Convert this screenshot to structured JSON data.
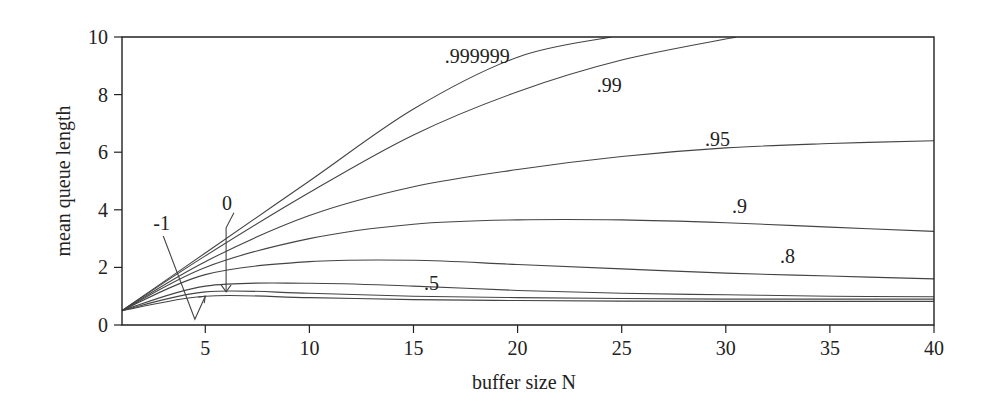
{
  "chart_data": {
    "type": "line",
    "title": "",
    "xlabel": "buffer size N",
    "ylabel": "mean queue length",
    "xlim": [
      1,
      40
    ],
    "ylim": [
      0,
      10
    ],
    "xticks": [
      5,
      10,
      15,
      20,
      25,
      30,
      35,
      40
    ],
    "yticks": [
      0,
      2,
      4,
      6,
      8,
      10
    ],
    "grid": false,
    "legend": "inline curve labels",
    "series": [
      {
        "name": ".999999",
        "x": [
          1,
          5,
          10,
          15,
          20,
          24.5
        ],
        "y": [
          0.5,
          2.5,
          5.0,
          7.5,
          9.3,
          10.0
        ]
      },
      {
        "name": ".99",
        "x": [
          1,
          5,
          10,
          15,
          20,
          25,
          30.5
        ],
        "y": [
          0.5,
          2.4,
          4.6,
          6.6,
          8.1,
          9.2,
          10.0
        ]
      },
      {
        "name": ".95",
        "x": [
          1,
          5,
          10,
          15,
          20,
          25,
          30,
          35,
          40
        ],
        "y": [
          0.5,
          2.2,
          3.8,
          4.8,
          5.4,
          5.85,
          6.15,
          6.3,
          6.4
        ]
      },
      {
        "name": ".9",
        "x": [
          1,
          5,
          10,
          15,
          20,
          25,
          30,
          35,
          40
        ],
        "y": [
          0.5,
          2.0,
          3.0,
          3.5,
          3.65,
          3.65,
          3.55,
          3.4,
          3.25
        ]
      },
      {
        "name": ".8",
        "x": [
          1,
          5,
          10,
          15,
          20,
          25,
          30,
          35,
          40
        ],
        "y": [
          0.5,
          1.75,
          2.2,
          2.25,
          2.1,
          1.95,
          1.8,
          1.7,
          1.6
        ]
      },
      {
        "name": ".5",
        "x": [
          1,
          5,
          10,
          15,
          20,
          25,
          30,
          35,
          40
        ],
        "y": [
          0.5,
          1.35,
          1.45,
          1.35,
          1.2,
          1.1,
          1.05,
          1.0,
          0.98
        ]
      },
      {
        "name": "0",
        "x": [
          1,
          5,
          10,
          15,
          20,
          25,
          30,
          35,
          40
        ],
        "y": [
          0.5,
          1.15,
          1.1,
          1.0,
          0.95,
          0.92,
          0.9,
          0.9,
          0.9
        ]
      },
      {
        "name": "-1",
        "x": [
          1,
          5,
          10,
          15,
          20,
          25,
          30,
          35,
          40
        ],
        "y": [
          0.5,
          1.0,
          0.95,
          0.88,
          0.85,
          0.83,
          0.82,
          0.82,
          0.82
        ]
      }
    ],
    "annotations": [
      {
        "text": ".999999",
        "x": 16.5,
        "y": 9.1
      },
      {
        "text": ".99",
        "x": 23.8,
        "y": 8.1
      },
      {
        "text": ".95",
        "x": 29.0,
        "y": 6.2
      },
      {
        "text": ".9",
        "x": 30.3,
        "y": 3.9
      },
      {
        "text": ".8",
        "x": 32.6,
        "y": 2.15
      },
      {
        "text": ".5",
        "x": 15.5,
        "y": 1.2
      },
      {
        "text": "0",
        "x": 5.8,
        "y": 4.0,
        "arrow_to": {
          "x": 6.0,
          "y": 1.15
        }
      },
      {
        "text": "-1",
        "x": 2.5,
        "y": 3.3,
        "arrow_to": {
          "x": 5.0,
          "y": 1.0
        }
      }
    ]
  }
}
